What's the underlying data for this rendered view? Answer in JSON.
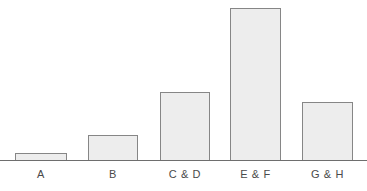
{
  "chart_data": {
    "type": "bar",
    "title": "",
    "subtitle": "",
    "xlabel": "",
    "ylabel": "",
    "categories": [
      "A",
      "B",
      "C & D",
      "E & F",
      "G & H"
    ],
    "values": [
      7,
      25,
      68,
      152,
      58
    ],
    "ylim": [
      0,
      160
    ],
    "grid": false,
    "legend": null,
    "axis": {
      "x_axis_visible": true,
      "y_axis_visible": false,
      "tick_labels_y": [],
      "tick_labels_x": [
        "A",
        "B",
        "C & D",
        "E & F",
        "G & H"
      ]
    },
    "annotations": [],
    "style": {
      "bar_fill": "#ededed",
      "bar_border": "#868686",
      "axis_color": "#6e6e6e",
      "label_color": "#4a4a4a",
      "background": "#ffffff"
    },
    "geometry": {
      "baseline_y": 161,
      "bars": [
        {
          "label": "A",
          "left": 15,
          "width": 52,
          "top": 154,
          "height": 7
        },
        {
          "label": "B",
          "left": 88,
          "width": 50,
          "top": 136,
          "height": 25
        },
        {
          "label": "C & D",
          "left": 160,
          "width": 50,
          "top": 93,
          "height": 68
        },
        {
          "label": "E & F",
          "left": 230,
          "width": 51,
          "top": 9,
          "height": 152
        },
        {
          "label": "G & H",
          "left": 302,
          "width": 51,
          "top": 103,
          "height": 58
        }
      ]
    }
  }
}
